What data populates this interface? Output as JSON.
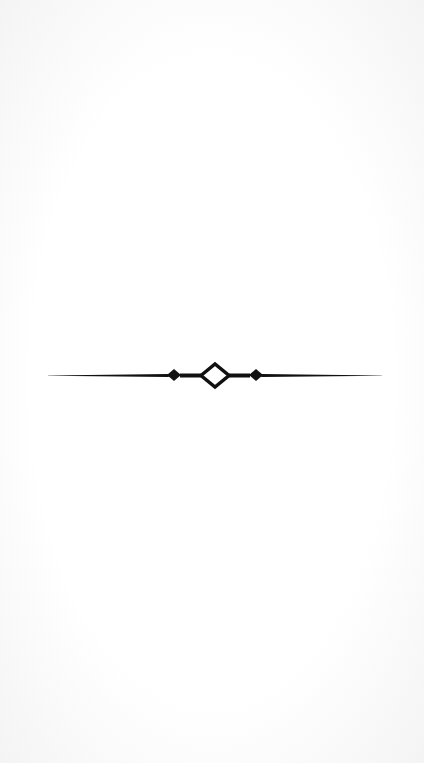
{
  "page": {
    "background": "#fdfdfd",
    "ornament": {
      "type": "divider-rule-with-diamonds",
      "icon": "ornamental-divider-icon",
      "color": "#111111"
    }
  }
}
